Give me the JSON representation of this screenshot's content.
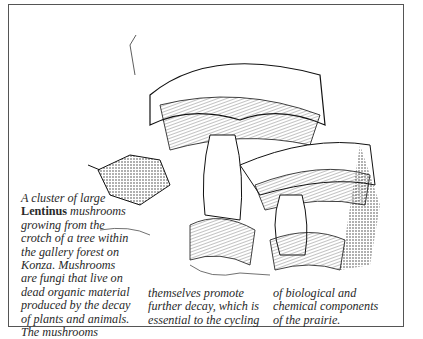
{
  "figure": {
    "illustration": "Pen-and-ink drawing of a cluster of large Lentinus mushrooms growing from a tree crotch",
    "caption": {
      "col1": {
        "line1": "A cluster of large",
        "genus": "Lentinus",
        "line2_rest": " mushrooms",
        "line3": "growing from the",
        "line4": "crotch of a tree within",
        "line5": "the gallery forest on",
        "line6": "Konza. Mushrooms",
        "line7": "are fungi that live on",
        "line8": "dead organic material",
        "line9": "produced by the decay",
        "line10": "of plants and animals.",
        "line11": "The mushrooms"
      },
      "col2": {
        "line1": "themselves promote",
        "line2": "further decay, which is",
        "line3": "essential to the cycling"
      },
      "col3": {
        "line1": "of biological and",
        "line2": "chemical components",
        "line3": "of the prairie."
      }
    }
  }
}
